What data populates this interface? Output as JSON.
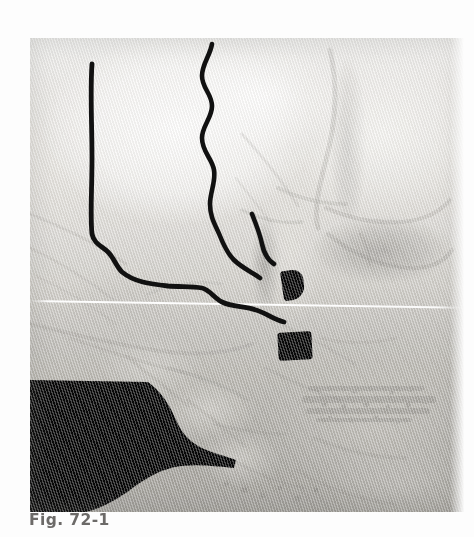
{
  "figure": {
    "caption": "Fig. 72-1",
    "caption_color": "#6c6a68",
    "modality": "3D CT reconstruction (grayscale scanned print)",
    "background_color": "#fdfdfd"
  },
  "scan": {
    "plate_x": 30,
    "plate_y": 38,
    "plate_width": 434,
    "plate_height": 474,
    "tone_light": "#efefed",
    "tone_mid": "#c9c7c2",
    "tone_dark": "#b4b2ac",
    "void_color": "#0a0a0a",
    "artifact_line_color": "#ffffff",
    "artifact_line_label": "scan-line artifact"
  },
  "annotations": {
    "ink_color": "#111111",
    "stroke_width": 4.6,
    "marks": [
      {
        "name": "left-outline-stroke",
        "description": "hand-drawn vertical line descending then turning right along the lower border",
        "path": "M 62 26 C 60 54, 62 86, 62 120 C 62 152, 60 178, 62 196 C 64 206, 72 208, 78 214 C 84 220, 86 228, 92 234 C 104 244, 120 246, 138 248 C 152 249, 162 248, 172 250 C 180 252, 184 260, 192 264 C 202 269, 214 268, 226 272 C 236 275, 244 282, 254 284"
      },
      {
        "name": "right-outline-stroke",
        "description": "hand-drawn wavy vertical line descending on the right then hooking left and down to a point",
        "path": "M 182 6 C 180 18, 172 26, 172 38 C 172 50, 182 56, 182 68 C 182 80, 172 88, 172 100 C 172 114, 182 120, 184 132 C 186 144, 180 154, 180 166 C 180 180, 186 188, 190 198 C 194 208, 198 216, 204 222 C 212 230, 222 234, 230 240"
      },
      {
        "name": "short-hook-stroke",
        "description": "short curved tick descending from the right stroke toward the condyle",
        "path": "M 222 176 C 226 186, 230 196, 232 206 C 234 216, 238 222, 244 226"
      }
    ]
  }
}
